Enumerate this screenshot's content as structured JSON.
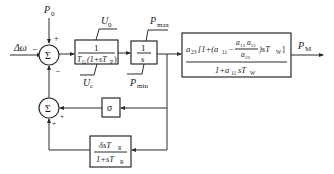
{
  "diagram": {
    "type": "block-diagram",
    "inputs": {
      "delta_omega": "Δω",
      "p0": "P",
      "p0_sub": "0"
    },
    "sum1": {
      "symbol": "Σ",
      "sign_left": "−",
      "sign_top": "+",
      "sign_bottom": "−"
    },
    "sum2": {
      "symbol": "Σ",
      "sign_right": "+",
      "sign_bottom": "+"
    },
    "block_servo": {
      "numerator": "1",
      "denominator": "T",
      "den_sub": "G",
      "den_rest": "(1+sT",
      "den_sub2": "P",
      "den_close": ")",
      "upper_limit": "U",
      "upper_limit_sub": "0",
      "lower_limit": "U",
      "lower_limit_sub": "c"
    },
    "block_integrator": {
      "numerator": "1",
      "denominator": "s",
      "upper_limit": "P",
      "upper_limit_sub": "max",
      "lower_limit": "P",
      "lower_limit_sub": "min"
    },
    "block_turbine": {
      "num_a23": "a",
      "num_a23_sub": "23",
      "num_mid": "[1+(a",
      "num_a11_sub": "11",
      "num_minus": "−",
      "frac_num": "a",
      "frac_num_sub1": "13",
      "frac_num_b": "a",
      "frac_num_sub2": "21",
      "frac_den": "a",
      "frac_den_sub": "23",
      "num_tail": ")sT",
      "num_tail_sub": "W",
      "num_close": "]",
      "den": "1+a",
      "den_sub": "11",
      "den_tail": "sT",
      "den_tail_sub": "W"
    },
    "block_sigma": {
      "label": "σ"
    },
    "block_transient_droop": {
      "numerator": "δsT",
      "num_sub": "R",
      "denominator": "1+sT",
      "den_sub": "R"
    },
    "output": {
      "label": "P",
      "label_sub": "M"
    }
  }
}
